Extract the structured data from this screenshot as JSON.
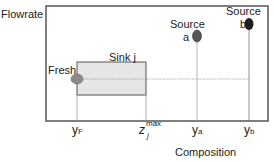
{
  "diagram": {
    "y_axis_label": "Flowrate",
    "x_axis_label": "Composition",
    "sink_label": "Sink j",
    "fresh_label": "Fresh",
    "source_a": {
      "line1": "Source",
      "line2": "a"
    },
    "source_b": {
      "line1": "Source",
      "line2": "b"
    },
    "ticks": {
      "yF": {
        "main": "y",
        "sub": "F"
      },
      "zmax": {
        "main": "z",
        "sub": "j",
        "sup": "max"
      },
      "ya": {
        "main": "y",
        "sub": "a"
      },
      "yb": {
        "main": "y",
        "sub": "b"
      }
    },
    "colors": {
      "frame": "#555555",
      "sink_fill": "#e6e6e6",
      "fresh_fill": "#8a8a8a",
      "source_a_fill": "#555555",
      "source_b_fill": "#1e1e1e",
      "guide_line": "#aaaaaa"
    }
  }
}
